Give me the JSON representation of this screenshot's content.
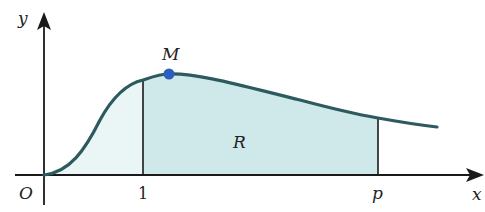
{
  "diagram": {
    "type": "area-under-curve",
    "labels": {
      "y_axis": "y",
      "x_axis": "x",
      "origin": "O",
      "tick_one": "1",
      "tick_p": "p",
      "max_point": "M",
      "region": "R"
    },
    "colors": {
      "curve": "#2d5a5e",
      "region_fill": "#cfe8ea",
      "left_fill": "#eaf5f6",
      "axis": "#1a1a1a",
      "point": "#2a5fbf"
    }
  }
}
